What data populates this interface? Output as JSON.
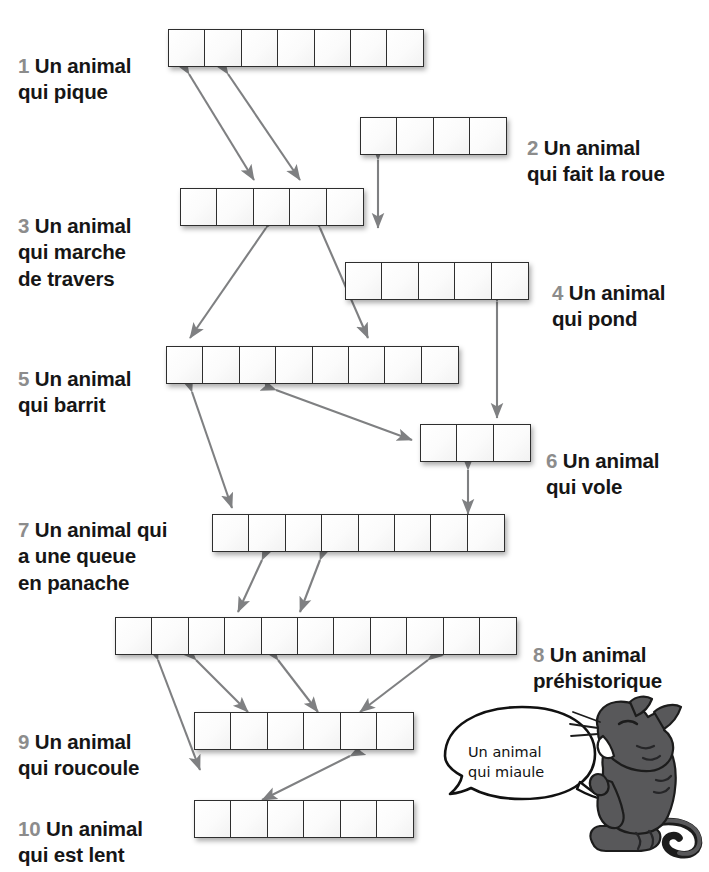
{
  "worksheet": {
    "language": "fr",
    "clues": [
      {
        "number": "1",
        "text": "Un animal\nqui pique",
        "cells": 7,
        "side": "left"
      },
      {
        "number": "2",
        "text": "Un animal\nqui fait la roue",
        "cells": 4,
        "side": "right"
      },
      {
        "number": "3",
        "text": "Un animal\nqui marche\nde travers",
        "cells": 5,
        "side": "left"
      },
      {
        "number": "4",
        "text": "Un animal\nqui pond",
        "cells": 5,
        "side": "right"
      },
      {
        "number": "5",
        "text": "Un animal\nqui barrit",
        "cells": 8,
        "side": "left"
      },
      {
        "number": "6",
        "text": "Un animal\nqui vole",
        "cells": 3,
        "side": "right"
      },
      {
        "number": "7",
        "text": "Un animal qui\na une queue\nen panache",
        "cells": 8,
        "side": "left"
      },
      {
        "number": "8",
        "text": "Un animal\npréhistorique",
        "cells": 11,
        "side": "right"
      },
      {
        "number": "9",
        "text": "Un animal\nqui roucoule",
        "cells": 6,
        "side": "left"
      },
      {
        "number": "10",
        "text": "Un animal\nqui est lent",
        "cells": 6,
        "side": "left"
      }
    ],
    "cat": {
      "bubble_text": "Un animal\nqui miaule",
      "illustration_name": "cartoon-cat"
    },
    "colors": {
      "number": "#8c8c8c",
      "text": "#161616",
      "arrow": "#7f8082",
      "cell_border": "#2e2e2e",
      "cat_body": "#58585a"
    }
  }
}
